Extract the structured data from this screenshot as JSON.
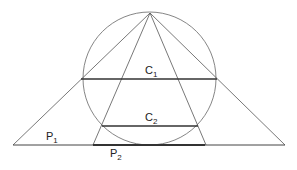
{
  "diagram": {
    "labels": {
      "c1": {
        "main": "C",
        "sub": "1"
      },
      "c2": {
        "main": "C",
        "sub": "2"
      },
      "p1": {
        "main": "P",
        "sub": "1"
      },
      "p2": {
        "main": "P",
        "sub": "2"
      }
    },
    "colors": {
      "stroke": "#555555",
      "thick": "#333333",
      "background": "#ffffff"
    },
    "geometry": {
      "apex": [
        150,
        13
      ],
      "circle": {
        "cx": 149.5,
        "cy": 78.5,
        "r": 66.5
      },
      "base_line": [
        [
          13,
          145
        ],
        [
          285,
          145
        ]
      ],
      "chord_c1": [
        [
          81,
          79
        ],
        [
          217,
          79
        ]
      ],
      "chord_c2": [
        [
          102,
          126
        ],
        [
          198,
          126
        ]
      ],
      "segment_p2": [
        [
          93,
          145
        ],
        [
          205,
          145
        ]
      ]
    }
  }
}
